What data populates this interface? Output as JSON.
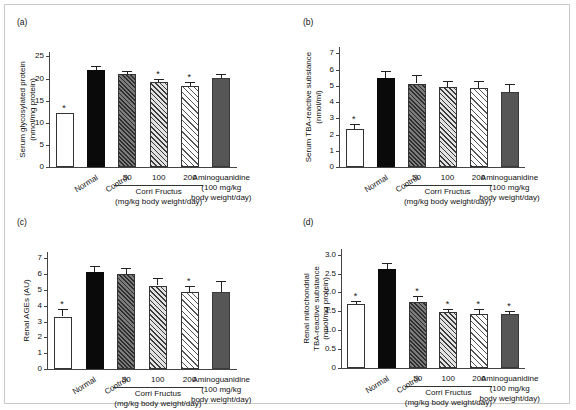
{
  "figure": {
    "panels": [
      "a",
      "b",
      "c",
      "d"
    ],
    "shared_x_categories": [
      "Normal",
      "Control",
      "50",
      "100",
      "200",
      "Aminoguanidine"
    ],
    "group_label_corni": "Corri Fructus",
    "group_label_corni_units": "(mg/kg body weight/day)",
    "amino_label_l1": "Aminoguanidine",
    "amino_label_l2": "(100 mg/kg",
    "amino_label_l3": "body weight/day)"
  },
  "chart_data": [
    {
      "type": "bar",
      "panel": "a",
      "title": "(a)",
      "ylabel_line1": "Serum glycosylated protein",
      "ylabel_line2": "(nmol/mg protein)",
      "xlabel": "",
      "categories": [
        "Normal",
        "Control",
        "50",
        "100",
        "200",
        "Aminoguanidine"
      ],
      "values": [
        12.2,
        22.0,
        21.0,
        19.3,
        18.3,
        20.1
      ],
      "errors": [
        0.0,
        0.75,
        0.75,
        0.6,
        0.9,
        0.85
      ],
      "significance": [
        true,
        false,
        false,
        true,
        true,
        false
      ],
      "fills": [
        "white",
        "black",
        "hatch-dark",
        "hatch-medium",
        "hatch-light",
        "solid-gray"
      ],
      "ylim": [
        0,
        26
      ],
      "yticks": [
        0,
        5,
        10,
        15,
        20,
        25
      ],
      "ytick_labels": [
        "0",
        "5",
        "10",
        "15",
        "20",
        "25"
      ],
      "grid": false,
      "legend": "none"
    },
    {
      "type": "bar",
      "panel": "b",
      "title": "(b)",
      "ylabel_line1": "Serum TBA-reactive substance",
      "ylabel_line2": "(nmol/ml)",
      "xlabel": "",
      "categories": [
        "Normal",
        "Control",
        "50",
        "100",
        "200",
        "Aminoguanidine"
      ],
      "values": [
        2.35,
        5.5,
        5.15,
        4.95,
        4.88,
        4.6
      ],
      "errors": [
        0.3,
        0.45,
        0.52,
        0.35,
        0.45,
        0.55
      ],
      "significance": [
        true,
        false,
        false,
        false,
        false,
        false
      ],
      "fills": [
        "white",
        "black",
        "hatch-dark",
        "hatch-medium",
        "hatch-light",
        "solid-gray"
      ],
      "ylim": [
        0,
        7.4
      ],
      "yticks": [
        0,
        1,
        2,
        3,
        4,
        5,
        6,
        7
      ],
      "ytick_labels": [
        "0",
        "1",
        "2",
        "3",
        "4",
        "5",
        "6",
        "7"
      ],
      "grid": false,
      "legend": "none"
    },
    {
      "type": "bar",
      "panel": "c",
      "title": "(c)",
      "ylabel_line1": "Renal AGEs (AU)",
      "ylabel_line2": "",
      "xlabel": "",
      "categories": [
        "Normal",
        "Control",
        "50",
        "100",
        "200",
        "Aminoguanidine"
      ],
      "values": [
        3.32,
        6.15,
        6.0,
        5.28,
        4.9,
        4.9
      ],
      "errors": [
        0.45,
        0.35,
        0.4,
        0.5,
        0.35,
        0.68
      ],
      "significance": [
        true,
        false,
        false,
        false,
        true,
        false
      ],
      "fills": [
        "white",
        "black",
        "hatch-dark",
        "hatch-medium",
        "hatch-light",
        "solid-gray"
      ],
      "ylim": [
        0,
        7.4
      ],
      "yticks": [
        0,
        1,
        2,
        3,
        4,
        5,
        6,
        7
      ],
      "ytick_labels": [
        "0",
        "1",
        "2",
        "3",
        "4",
        "5",
        "6",
        "7"
      ],
      "grid": false,
      "legend": "none"
    },
    {
      "type": "bar",
      "panel": "d",
      "title": "(d)",
      "ylabel_line1": "Renal mitochondrial",
      "ylabel_line2": "TBA-reactive substance",
      "ylabel_line3": "(nmol/mg protein)",
      "xlabel": "",
      "categories": [
        "Normal",
        "Control",
        "50",
        "100",
        "200",
        "Aminoguanidine"
      ],
      "values": [
        1.7,
        2.62,
        1.76,
        1.49,
        1.43,
        1.42
      ],
      "errors": [
        0.07,
        0.17,
        0.14,
        0.08,
        0.12,
        0.1
      ],
      "significance": [
        true,
        false,
        true,
        true,
        true,
        true
      ],
      "fills": [
        "white",
        "black",
        "hatch-dark",
        "hatch-medium",
        "hatch-light",
        "solid-gray"
      ],
      "ylim": [
        0,
        3.15
      ],
      "yticks": [
        0,
        0.5,
        1.0,
        1.5,
        2.0,
        2.5,
        3.0
      ],
      "ytick_labels": [
        "0",
        "0.5",
        "1.0",
        "1.5",
        "2.0",
        "2.5",
        "3.0"
      ],
      "grid": false,
      "legend": "none"
    }
  ],
  "colors": {
    "white_bar": "#ffffff",
    "black_bar": "#0a0a0a",
    "solid_gray_bar": "#565656",
    "hatch_dark": "#2e2e2e",
    "axis": "#444444",
    "text": "#111111",
    "frame": "#c9c9c9"
  }
}
